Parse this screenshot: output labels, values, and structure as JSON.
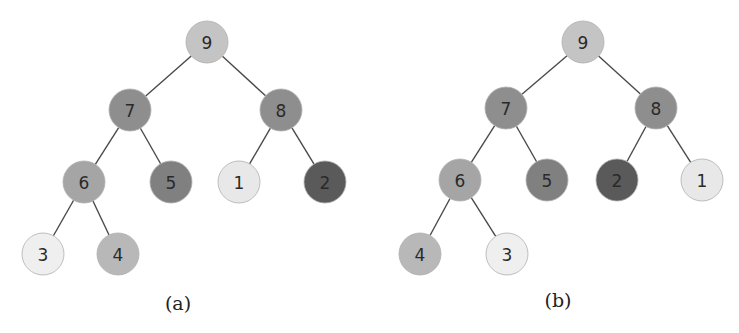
{
  "figures": [
    {
      "id": "a",
      "caption": "(a)",
      "caption_pos": [
        178,
        303
      ],
      "nodes": [
        {
          "label": "9",
          "x": 207,
          "y": 42,
          "fill": "#c4c4c4"
        },
        {
          "label": "7",
          "x": 130,
          "y": 110,
          "fill": "#8e8e8e"
        },
        {
          "label": "8",
          "x": 281,
          "y": 110,
          "fill": "#8e8e8e"
        },
        {
          "label": "6",
          "x": 84,
          "y": 182,
          "fill": "#a5a5a5"
        },
        {
          "label": "5",
          "x": 171,
          "y": 182,
          "fill": "#808080"
        },
        {
          "label": "1",
          "x": 239,
          "y": 182,
          "fill": "#e8e8e8"
        },
        {
          "label": "2",
          "x": 325,
          "y": 182,
          "fill": "#5a5a5a"
        },
        {
          "label": "3",
          "x": 43,
          "y": 254,
          "fill": "#efefef"
        },
        {
          "label": "4",
          "x": 118,
          "y": 254,
          "fill": "#b8b8b8"
        }
      ],
      "edges": [
        [
          0,
          1
        ],
        [
          0,
          2
        ],
        [
          1,
          3
        ],
        [
          1,
          4
        ],
        [
          2,
          5
        ],
        [
          2,
          6
        ],
        [
          3,
          7
        ],
        [
          3,
          8
        ]
      ]
    },
    {
      "id": "b",
      "caption": "(b)",
      "caption_pos": [
        558,
        300
      ],
      "nodes": [
        {
          "label": "9",
          "x": 583,
          "y": 42,
          "fill": "#c4c4c4"
        },
        {
          "label": "7",
          "x": 506,
          "y": 108,
          "fill": "#8e8e8e"
        },
        {
          "label": "8",
          "x": 656,
          "y": 108,
          "fill": "#8e8e8e"
        },
        {
          "label": "6",
          "x": 460,
          "y": 180,
          "fill": "#a5a5a5"
        },
        {
          "label": "5",
          "x": 547,
          "y": 180,
          "fill": "#808080"
        },
        {
          "label": "2",
          "x": 617,
          "y": 180,
          "fill": "#5a5a5a"
        },
        {
          "label": "1",
          "x": 702,
          "y": 180,
          "fill": "#e8e8e8"
        },
        {
          "label": "4",
          "x": 420,
          "y": 254,
          "fill": "#b8b8b8"
        },
        {
          "label": "3",
          "x": 507,
          "y": 254,
          "fill": "#efefef"
        }
      ],
      "edges": [
        [
          0,
          1
        ],
        [
          0,
          2
        ],
        [
          1,
          3
        ],
        [
          1,
          4
        ],
        [
          2,
          5
        ],
        [
          2,
          6
        ],
        [
          3,
          7
        ],
        [
          3,
          8
        ]
      ]
    }
  ],
  "style": {
    "node_radius": 21,
    "edge_color": "#4a4a4a"
  }
}
